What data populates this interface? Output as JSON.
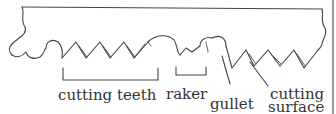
{
  "diagram": {
    "labels": {
      "cutting_teeth": "cutting teeth",
      "raker": "raker",
      "gullet": "gullet",
      "cutting_surface_line1": "cutting",
      "cutting_surface_line2": "surface"
    },
    "colors": {
      "stroke": "#444444",
      "text": "#333333",
      "background": "#ffffff"
    }
  }
}
